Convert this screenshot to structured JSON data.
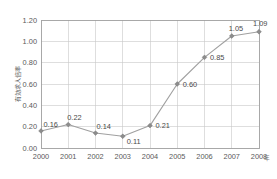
{
  "chart_data": {
    "type": "line",
    "title": "",
    "subtitle": "",
    "xlabel": "年",
    "ylabel": "有効求人倍率",
    "categories": [
      "2000",
      "2001",
      "2002",
      "2003",
      "2004",
      "2005",
      "2006",
      "2007",
      "2008"
    ],
    "series": [
      {
        "name": "有効求人倍率",
        "values": [
          0.16,
          0.22,
          0.14,
          0.11,
          0.21,
          0.6,
          0.85,
          1.05,
          1.09
        ],
        "point_labels": [
          "0.16",
          "0.22",
          "0.14",
          "0.11",
          "0.21",
          "0.60",
          "0.85",
          "1.05",
          "1.09"
        ],
        "color": "#a0a0a0",
        "marker": "diamond",
        "marker_color": "#8c8c8c"
      }
    ],
    "ylim": [
      0.0,
      1.2
    ],
    "y_ticks": [
      0.0,
      0.2,
      0.4,
      0.6,
      0.8,
      1.0,
      1.2
    ],
    "y_tick_labels": [
      "0.00",
      "0.20",
      "0.40",
      "0.60",
      "0.80",
      "1.00",
      "1.20"
    ],
    "x_ticks": [
      "2000",
      "2001",
      "2002",
      "2003",
      "2004",
      "2005",
      "2006",
      "2007",
      "2008"
    ],
    "grid": {
      "horizontal": true,
      "vertical": true,
      "color": "#c8c8c8"
    },
    "legend": {
      "visible": false,
      "position": "none",
      "entries": []
    },
    "plot_area": {
      "left": 41,
      "top": 20,
      "right": 259,
      "bottom": 148
    },
    "background_color": "#ffffff",
    "axis_color": "#9a9a9a",
    "text_color": "#5a5a5a"
  }
}
